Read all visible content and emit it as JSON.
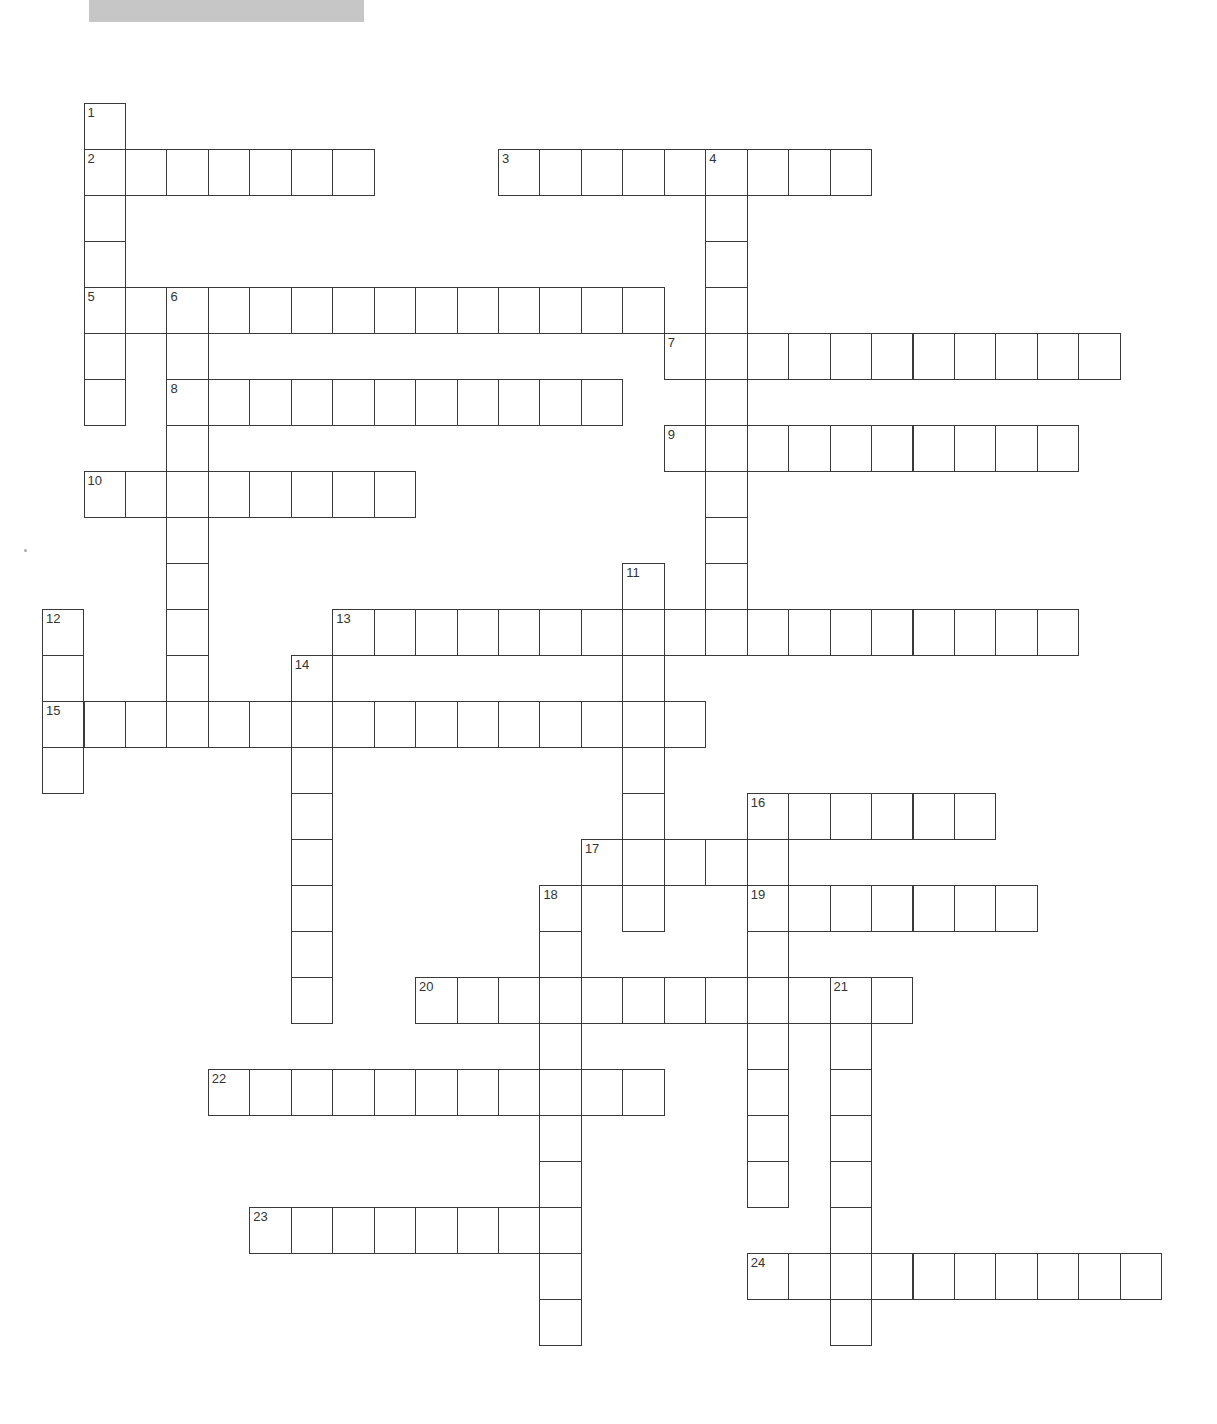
{
  "header": {
    "title_bar_color": "#c6c6c6"
  },
  "grid": {
    "origin_x": 42,
    "origin_y": 103,
    "cell_width": 41.45,
    "cell_height": 46,
    "border_color": "#3a3a3a"
  },
  "entries": [
    {
      "number": "1",
      "direction": "down",
      "col": 1,
      "row": 0,
      "length": 7
    },
    {
      "number": "2",
      "direction": "across",
      "col": 1,
      "row": 1,
      "length": 7
    },
    {
      "number": "3",
      "direction": "across",
      "col": 11,
      "row": 1,
      "length": 9
    },
    {
      "number": "4",
      "direction": "down",
      "col": 16,
      "row": 1,
      "length": 11
    },
    {
      "number": "5",
      "direction": "across",
      "col": 1,
      "row": 4,
      "length": 14
    },
    {
      "number": "6",
      "direction": "down",
      "col": 3,
      "row": 4,
      "length": 10
    },
    {
      "number": "7",
      "direction": "across",
      "col": 15,
      "row": 5,
      "length": 11
    },
    {
      "number": "8",
      "direction": "across",
      "col": 3,
      "row": 6,
      "length": 11
    },
    {
      "number": "9",
      "direction": "across",
      "col": 15,
      "row": 7,
      "length": 10
    },
    {
      "number": "10",
      "direction": "across",
      "col": 1,
      "row": 8,
      "length": 8
    },
    {
      "number": "11",
      "direction": "down",
      "col": 14,
      "row": 10,
      "length": 8
    },
    {
      "number": "12",
      "direction": "down",
      "col": 0,
      "row": 11,
      "length": 4
    },
    {
      "number": "13",
      "direction": "across",
      "col": 7,
      "row": 11,
      "length": 18
    },
    {
      "number": "14",
      "direction": "down",
      "col": 6,
      "row": 12,
      "length": 8
    },
    {
      "number": "15",
      "direction": "across",
      "col": 0,
      "row": 13,
      "length": 16
    },
    {
      "number": "16",
      "direction": "across",
      "col": 17,
      "row": 15,
      "length": 6
    },
    {
      "number": "16",
      "direction": "down",
      "col": 17,
      "row": 15,
      "length": 9
    },
    {
      "number": "17",
      "direction": "across",
      "col": 13,
      "row": 16,
      "length": 5
    },
    {
      "number": "18",
      "direction": "down",
      "col": 12,
      "row": 17,
      "length": 10
    },
    {
      "number": "19",
      "direction": "across",
      "col": 17,
      "row": 17,
      "length": 7
    },
    {
      "number": "20",
      "direction": "across",
      "col": 9,
      "row": 19,
      "length": 12
    },
    {
      "number": "21",
      "direction": "down",
      "col": 19,
      "row": 19,
      "length": 8
    },
    {
      "number": "22",
      "direction": "across",
      "col": 4,
      "row": 21,
      "length": 11
    },
    {
      "number": "23",
      "direction": "across",
      "col": 5,
      "row": 24,
      "length": 8
    },
    {
      "number": "24",
      "direction": "across",
      "col": 17,
      "row": 25,
      "length": 10
    }
  ]
}
